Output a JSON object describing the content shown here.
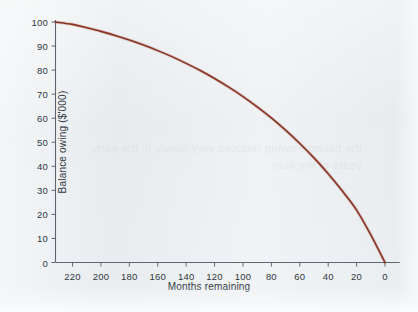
{
  "figure": {
    "background_color": "#e7ebee",
    "cropped_title_fragment": "",
    "bleed_through_text": "the balance owing reduces very slowly in the early years of the loan"
  },
  "chart_data": {
    "type": "line",
    "title": "",
    "xlabel": "Months remaining",
    "ylabel": "Balance owing ($'000)",
    "x_tick_labels": [
      "220",
      "200",
      "180",
      "160",
      "140",
      "120",
      "100",
      "80",
      "60",
      "40",
      "20",
      "0"
    ],
    "x_ticks": [
      220,
      200,
      180,
      160,
      140,
      120,
      100,
      80,
      60,
      40,
      20,
      0
    ],
    "y_tick_labels": [
      "100",
      "90",
      "80",
      "70",
      "60",
      "50",
      "40",
      "30",
      "20",
      "10",
      "0"
    ],
    "y_ticks": [
      100,
      90,
      80,
      70,
      60,
      50,
      40,
      30,
      20,
      10,
      0
    ],
    "xlim": [
      232,
      0
    ],
    "ylim": [
      0,
      100
    ],
    "x_axis_reversed": true,
    "grid": false,
    "legend": false,
    "series": [
      {
        "name": "Balance owing",
        "color": "#8a3322",
        "line_width": 1.6,
        "x": [
          232,
          220,
          210,
          200,
          190,
          180,
          170,
          160,
          150,
          140,
          130,
          120,
          110,
          100,
          90,
          80,
          70,
          60,
          50,
          40,
          30,
          20,
          10,
          0
        ],
        "values": [
          100.0,
          99.0,
          97.6,
          96.1,
          94.4,
          92.5,
          90.4,
          88.1,
          85.6,
          82.8,
          79.8,
          76.5,
          72.9,
          69.0,
          64.7,
          60.1,
          55.0,
          49.5,
          43.5,
          36.9,
          29.7,
          21.8,
          11.5,
          0.0
        ]
      }
    ]
  },
  "axes": {
    "axis_color": "#5d6670",
    "tick_direction": "outward"
  }
}
